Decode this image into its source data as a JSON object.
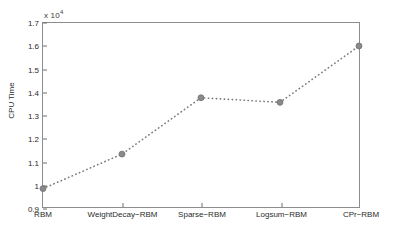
{
  "chart_data": {
    "type": "line",
    "title": "",
    "xlabel": "",
    "ylabel": "CPU Time",
    "y_exponent_label": "x 10",
    "y_exponent_power": "4",
    "y_scale": 10000,
    "categories": [
      "RBM",
      "WeightDecay−RBM",
      "Sparse−RBM",
      "Logsum−RBM",
      "CPr−RBM"
    ],
    "values": [
      0.98,
      1.13,
      1.375,
      1.355,
      1.6
    ],
    "values_absolute": [
      9800,
      11300,
      13750,
      13550,
      16000
    ],
    "ylim": [
      0.9,
      1.7
    ],
    "yticks": [
      "0.9",
      "1",
      "1.1",
      "1.2",
      "1.3",
      "1.4",
      "1.5",
      "1.6",
      "1.7"
    ],
    "ytick_values": [
      0.9,
      1.0,
      1.1,
      1.2,
      1.3,
      1.4,
      1.5,
      1.6,
      1.7
    ],
    "grid": false,
    "legend": "none",
    "line_style": "dotted",
    "marker": "circle",
    "series_color": "#7a7a7a",
    "marker_color": "#8a8a8a",
    "axis_color": "#8d8d8d"
  }
}
